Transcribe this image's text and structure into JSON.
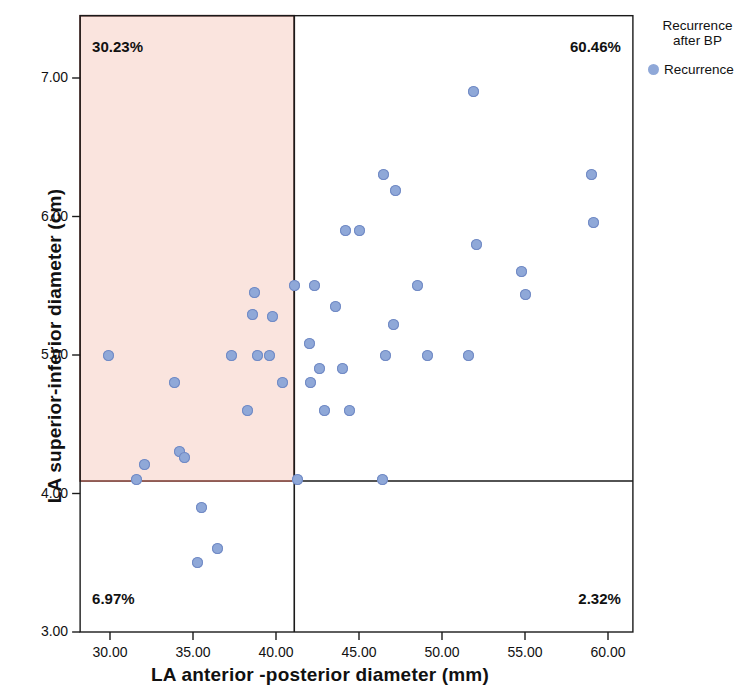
{
  "chart_data": {
    "type": "scatter",
    "title": "",
    "xlabel": "LA anterior -posterior diameter (mm)",
    "ylabel": "LA superior-inferior diameter (cm)",
    "xlim": [
      28.2,
      61.5
    ],
    "ylim": [
      3.0,
      7.45
    ],
    "xticks": [
      "30.00",
      "35.00",
      "40.00",
      "45.00",
      "50.00",
      "55.00",
      "60.00"
    ],
    "xtick_values": [
      30,
      35,
      40,
      45,
      50,
      55,
      60
    ],
    "yticks": [
      "3.00",
      "4.00",
      "5.00",
      "6.00",
      "7.00"
    ],
    "ytick_values": [
      3,
      4,
      5,
      6,
      7
    ],
    "grid": false,
    "legend_position": "right",
    "marker_color": "#8fa8d8",
    "marker_edge_color": "#7089c4",
    "shaded_region_color": "#fae4de",
    "shaded_region_border": "#7a3b33",
    "reference_lines": {
      "x": 41.1,
      "y": 4.09
    },
    "shaded_region": {
      "x0": 28.2,
      "x1": 41.1,
      "y0": 4.09,
      "y1": 7.45
    },
    "quadrant_labels": [
      {
        "name": "upper-left",
        "text": "30.23%"
      },
      {
        "name": "upper-right",
        "text": "60.46%"
      },
      {
        "name": "lower-left",
        "text": "6.97%"
      },
      {
        "name": "lower-right",
        "text": "2.32%"
      }
    ],
    "series": [
      {
        "name": "Recurrence",
        "points": [
          [
            29.9,
            5.0
          ],
          [
            31.6,
            4.1
          ],
          [
            32.1,
            4.21
          ],
          [
            33.9,
            4.8
          ],
          [
            34.2,
            4.3
          ],
          [
            34.5,
            4.26
          ],
          [
            35.3,
            3.5
          ],
          [
            35.5,
            3.9
          ],
          [
            36.5,
            3.6
          ],
          [
            37.3,
            5.0
          ],
          [
            38.3,
            4.6
          ],
          [
            38.6,
            5.29
          ],
          [
            38.7,
            5.45
          ],
          [
            38.9,
            5.0
          ],
          [
            39.6,
            5.0
          ],
          [
            39.8,
            5.28
          ],
          [
            40.4,
            4.8
          ],
          [
            41.1,
            5.5
          ],
          [
            41.3,
            4.1
          ],
          [
            42.0,
            5.08
          ],
          [
            42.1,
            4.8
          ],
          [
            42.3,
            5.5
          ],
          [
            42.6,
            4.9
          ],
          [
            42.9,
            4.6
          ],
          [
            43.6,
            5.35
          ],
          [
            44.0,
            4.9
          ],
          [
            44.2,
            5.9
          ],
          [
            44.4,
            4.6
          ],
          [
            45.0,
            5.9
          ],
          [
            46.4,
            4.1
          ],
          [
            46.5,
            6.3
          ],
          [
            46.6,
            5.0
          ],
          [
            47.1,
            5.22
          ],
          [
            47.2,
            6.19
          ],
          [
            48.5,
            5.5
          ],
          [
            49.1,
            5.0
          ],
          [
            51.6,
            5.0
          ],
          [
            51.9,
            6.9
          ],
          [
            52.1,
            5.8
          ],
          [
            54.8,
            5.6
          ],
          [
            55.0,
            5.44
          ],
          [
            59.0,
            6.3
          ],
          [
            59.1,
            5.96
          ]
        ]
      }
    ],
    "legend": {
      "title": "Recurrence\nafter BP",
      "entries": [
        {
          "label": "Recurrence",
          "color": "#8fa8d8"
        }
      ]
    }
  }
}
